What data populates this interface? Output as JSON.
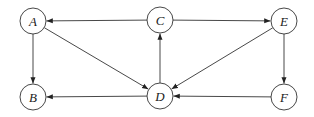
{
  "diagram": {
    "type": "directed-graph",
    "nodes": [
      {
        "id": "A",
        "label": "A",
        "x": 33,
        "y": 21
      },
      {
        "id": "C",
        "label": "C",
        "x": 160,
        "y": 20
      },
      {
        "id": "E",
        "label": "E",
        "x": 284,
        "y": 21
      },
      {
        "id": "B",
        "label": "B",
        "x": 33,
        "y": 97
      },
      {
        "id": "D",
        "label": "D",
        "x": 160,
        "y": 96
      },
      {
        "id": "F",
        "label": "F",
        "x": 284,
        "y": 97
      }
    ],
    "edges": [
      {
        "from": "C",
        "to": "A"
      },
      {
        "from": "C",
        "to": "E"
      },
      {
        "from": "A",
        "to": "B"
      },
      {
        "from": "A",
        "to": "D"
      },
      {
        "from": "D",
        "to": "C"
      },
      {
        "from": "E",
        "to": "D"
      },
      {
        "from": "E",
        "to": "F"
      },
      {
        "from": "D",
        "to": "B"
      },
      {
        "from": "F",
        "to": "D"
      }
    ],
    "node_radius": 13,
    "stroke_color": "#333333"
  }
}
